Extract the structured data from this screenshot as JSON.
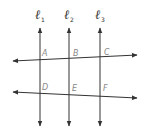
{
  "diagram": {
    "colors": {
      "line": "#333333",
      "point_label": "#888888"
    },
    "parallel_lines": [
      {
        "name": "l1",
        "symbol": "ℓ",
        "subscript": "1",
        "x": 40
      },
      {
        "name": "l2",
        "symbol": "ℓ",
        "subscript": "2",
        "x": 69
      },
      {
        "name": "l3",
        "symbol": "ℓ",
        "subscript": "3",
        "x": 100
      }
    ],
    "transversals": [
      {
        "name": "top",
        "from": [
          13,
          61
        ],
        "to": [
          136,
          55
        ]
      },
      {
        "name": "bottom",
        "from": [
          13,
          92
        ],
        "to": [
          136,
          98
        ]
      }
    ],
    "points": [
      {
        "label": "A",
        "x": 42,
        "y": 55
      },
      {
        "label": "B",
        "x": 73,
        "y": 55
      },
      {
        "label": "C",
        "x": 104,
        "y": 54
      },
      {
        "label": "D",
        "x": 42,
        "y": 89
      },
      {
        "label": "E",
        "x": 73,
        "y": 90
      },
      {
        "label": "F",
        "x": 104,
        "y": 90
      }
    ]
  }
}
